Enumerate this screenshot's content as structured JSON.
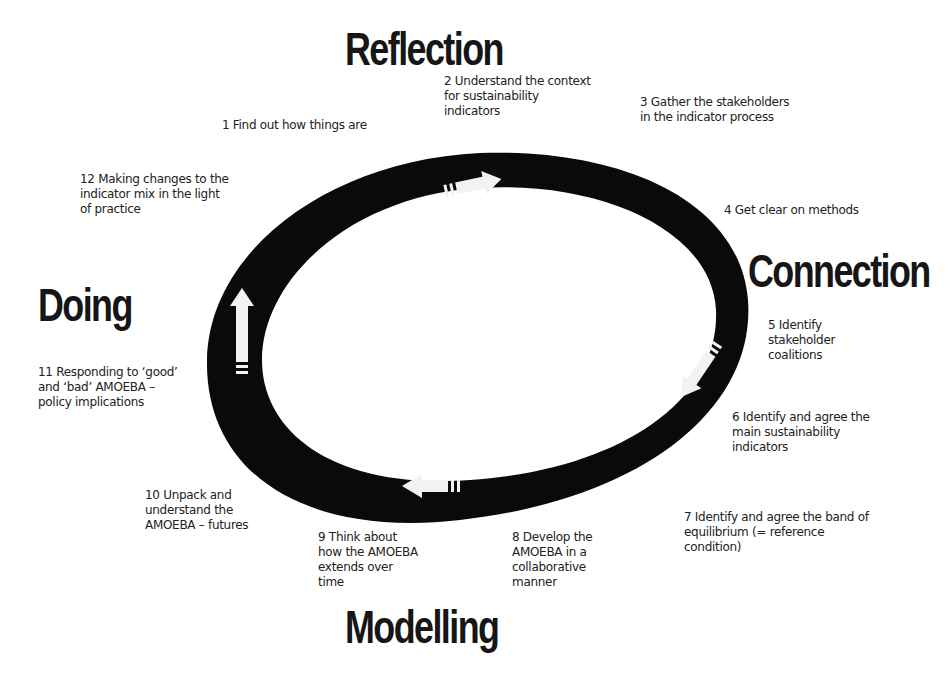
{
  "phases": {
    "reflection": "Reflection",
    "connection": "Connection",
    "modelling": "Modelling",
    "doing": "Doing"
  },
  "steps": [
    {
      "n": "1",
      "lines": [
        "1  Find out how things are"
      ]
    },
    {
      "n": "2",
      "lines": [
        "2  Understand the context",
        "for sustainability",
        "indicators"
      ]
    },
    {
      "n": "3",
      "lines": [
        "3  Gather the stakeholders",
        "in the indicator process"
      ]
    },
    {
      "n": "4",
      "lines": [
        "4  Get clear on methods"
      ]
    },
    {
      "n": "5",
      "lines": [
        "5  Identify",
        "stakeholder",
        "coalitions"
      ]
    },
    {
      "n": "6",
      "lines": [
        "6  Identify and agree the",
        "main sustainability",
        "indicators"
      ]
    },
    {
      "n": "7",
      "lines": [
        "7  Identify and agree the band of",
        "equilibrium (= reference",
        "condition)"
      ]
    },
    {
      "n": "8",
      "lines": [
        "8  Develop the",
        "AMOEBA in a",
        "collaborative",
        "manner"
      ]
    },
    {
      "n": "9",
      "lines": [
        "9  Think about",
        "how the AMOEBA",
        "extends over",
        "time"
      ]
    },
    {
      "n": "10",
      "lines": [
        "10  Unpack and",
        "understand the",
        "AMOEBA – futures"
      ]
    },
    {
      "n": "11",
      "lines": [
        "11  Responding to ‘good’",
        "and ‘bad’ AMOEBA –",
        "policy implications"
      ]
    },
    {
      "n": "12",
      "lines": [
        "12  Making changes to the",
        "indicator mix in the light",
        "of practice"
      ]
    }
  ],
  "diagram": {
    "ring_color": "#0a0a0a",
    "arrow_color": "#f2f2f2",
    "arrows": [
      "right-arrow-icon",
      "down-left-arrow-icon",
      "left-arrow-icon",
      "up-arrow-icon"
    ]
  }
}
